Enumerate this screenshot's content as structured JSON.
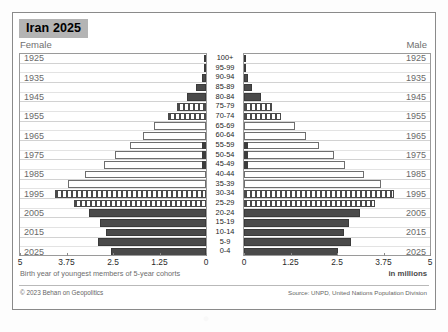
{
  "title": "Iran 2025",
  "female_label": "Female",
  "male_label": "Male",
  "axis_note": "Birth year of youngest members of 5-year cohorts",
  "units_label": "in millions",
  "credit": "© 2023 Behan on Geopolitics",
  "source": "Source: UNPD, United Nations Population Division",
  "colors": {
    "title_highlight": "#b4b4b4",
    "bar_solid": "#4a4a4a",
    "bar_outline": "#6e6e6e",
    "card_border": "#8a8a8a",
    "gridline": "#e3e3e3",
    "label_gray": "#6f6f6f"
  },
  "chart_data": {
    "type": "bar",
    "subtype": "population-pyramid",
    "title": "Iran 2025",
    "xlabel": "in millions",
    "ylabel": "Age group",
    "xlim": [
      0,
      5
    ],
    "grid": true,
    "legend": "none",
    "female_axis_ticks": [
      "5",
      "3.75",
      "2.5",
      "1.25",
      "0"
    ],
    "male_axis_ticks": [
      "0",
      "1.25",
      "2.5",
      "3.75",
      "5"
    ],
    "tick_values": [
      0,
      1.25,
      2.5,
      3.75,
      5
    ],
    "categories": [
      "100+",
      "95-99",
      "90-94",
      "85-89",
      "80-84",
      "75-79",
      "70-74",
      "65-69",
      "60-64",
      "55-59",
      "50-54",
      "45-49",
      "40-44",
      "35-39",
      "30-34",
      "25-29",
      "20-24",
      "15-19",
      "10-14",
      "5-9",
      "0-4"
    ],
    "birth_year_labels": [
      "1925",
      "",
      "1935",
      "",
      "1945",
      "",
      "1955",
      "",
      "1965",
      "",
      "1975",
      "",
      "1985",
      "",
      "1995",
      "",
      "2005",
      "",
      "2015",
      "",
      "2025"
    ],
    "series": [
      {
        "name": "Female",
        "side": "left",
        "values": [
          0.01,
          0.04,
          0.12,
          0.26,
          0.5,
          0.78,
          1.02,
          1.4,
          1.7,
          2.05,
          2.45,
          2.75,
          3.25,
          3.7,
          4.05,
          3.55,
          3.15,
          2.85,
          2.7,
          2.9,
          2.55
        ]
      },
      {
        "name": "Male",
        "side": "right",
        "values": [
          0.01,
          0.03,
          0.1,
          0.22,
          0.45,
          0.74,
          1.0,
          1.38,
          1.68,
          2.02,
          2.42,
          2.72,
          3.22,
          3.68,
          4.02,
          3.52,
          3.12,
          2.82,
          2.68,
          2.88,
          2.52
        ]
      }
    ],
    "bar_styles": [
      "tiny",
      "tiny",
      "tiny",
      "tiny",
      "solid",
      "hatch",
      "hatch",
      "open",
      "open",
      "open",
      "open",
      "open",
      "open",
      "open",
      "hatch",
      "hatch",
      "solid",
      "solid",
      "solid",
      "solid",
      "solid"
    ],
    "cap_segment_rows": [
      9,
      10,
      11
    ]
  }
}
